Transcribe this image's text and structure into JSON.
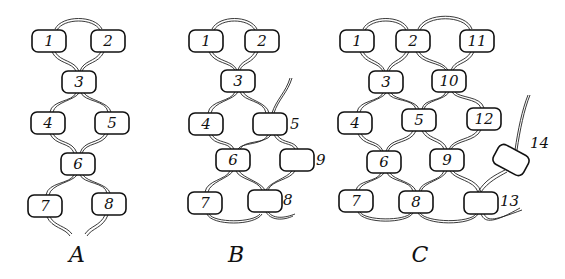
{
  "figure": {
    "panels": [
      {
        "label": "A",
        "beads": [
          {
            "id": "1",
            "x": 49,
            "y": 41
          },
          {
            "id": "2",
            "x": 108,
            "y": 41
          },
          {
            "id": "3",
            "x": 79,
            "y": 82
          },
          {
            "id": "4",
            "x": 48,
            "y": 123
          },
          {
            "id": "5",
            "x": 112,
            "y": 123
          },
          {
            "id": "6",
            "x": 78,
            "y": 164
          },
          {
            "id": "7",
            "x": 45,
            "y": 206
          },
          {
            "id": "8",
            "x": 109,
            "y": 204
          }
        ]
      },
      {
        "label": "B",
        "beads": [
          {
            "id": "1",
            "x": 206,
            "y": 41
          },
          {
            "id": "2",
            "x": 262,
            "y": 41
          },
          {
            "id": "3",
            "x": 238,
            "y": 81
          },
          {
            "id": "4",
            "x": 206,
            "y": 124
          },
          {
            "id": "5",
            "x": 270,
            "y": 124,
            "label_outside": true
          },
          {
            "id": "6",
            "x": 233,
            "y": 160
          },
          {
            "id": "9",
            "x": 297,
            "y": 160,
            "label_outside": true
          },
          {
            "id": "7",
            "x": 205,
            "y": 203
          },
          {
            "id": "8",
            "x": 265,
            "y": 201,
            "label_outside": true
          }
        ]
      },
      {
        "label": "C",
        "beads": [
          {
            "id": "1",
            "x": 357,
            "y": 41
          },
          {
            "id": "2",
            "x": 413,
            "y": 41
          },
          {
            "id": "11",
            "x": 477,
            "y": 41
          },
          {
            "id": "3",
            "x": 386,
            "y": 82
          },
          {
            "id": "10",
            "x": 449,
            "y": 81
          },
          {
            "id": "4",
            "x": 355,
            "y": 123
          },
          {
            "id": "5",
            "x": 419,
            "y": 120
          },
          {
            "id": "12",
            "x": 484,
            "y": 119,
            "label_inside_offset": true
          },
          {
            "id": "6",
            "x": 384,
            "y": 162
          },
          {
            "id": "9",
            "x": 447,
            "y": 160
          },
          {
            "id": "7",
            "x": 356,
            "y": 201
          },
          {
            "id": "8",
            "x": 416,
            "y": 202
          },
          {
            "id": "13",
            "x": 481,
            "y": 203,
            "label_outside": true
          },
          {
            "id": "14",
            "x": 511,
            "y": 160,
            "label_outside": true,
            "tilted": true
          }
        ]
      }
    ]
  }
}
